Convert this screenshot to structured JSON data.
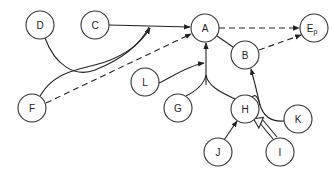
{
  "diagram": {
    "type": "directed-graph",
    "nodes": [
      {
        "id": "D",
        "label": "D",
        "x": 40,
        "y": 25
      },
      {
        "id": "C",
        "label": "C",
        "x": 95,
        "y": 25
      },
      {
        "id": "A",
        "label": "A",
        "x": 205,
        "y": 28
      },
      {
        "id": "Ep",
        "label": "E",
        "sub": "p",
        "x": 314,
        "y": 28
      },
      {
        "id": "B",
        "label": "B",
        "x": 245,
        "y": 55
      },
      {
        "id": "L",
        "label": "L",
        "x": 145,
        "y": 82
      },
      {
        "id": "G",
        "label": "G",
        "x": 178,
        "y": 108
      },
      {
        "id": "H",
        "label": "H",
        "x": 245,
        "y": 109
      },
      {
        "id": "K",
        "label": "K",
        "x": 298,
        "y": 119
      },
      {
        "id": "F",
        "label": "F",
        "x": 32,
        "y": 108
      },
      {
        "id": "J",
        "label": "J",
        "x": 218,
        "y": 152
      },
      {
        "id": "I",
        "label": "I",
        "x": 280,
        "y": 152
      }
    ],
    "edges": [
      {
        "from": "C",
        "to": "A",
        "style": "solid",
        "arrow": "filled"
      },
      {
        "from": "D",
        "to": "A",
        "style": "solid",
        "arrow": "filled"
      },
      {
        "from": "F",
        "to": "A",
        "style": "solid",
        "arrow": "filled"
      },
      {
        "from": "F",
        "to": "A",
        "style": "dashed",
        "arrow": "filled"
      },
      {
        "from": "A",
        "to": "Ep",
        "style": "dashed",
        "arrow": "filled"
      },
      {
        "from": "A",
        "to": "B",
        "style": "solid",
        "arrow": "none"
      },
      {
        "from": "B",
        "to": "Ep",
        "style": "dashed",
        "arrow": "filled"
      },
      {
        "from": "L",
        "to": "A",
        "style": "solid",
        "arrow": "filled"
      },
      {
        "from": "G",
        "to": "A",
        "style": "solid",
        "arrow": "filled"
      },
      {
        "from": "H",
        "to": "A",
        "style": "solid",
        "arrow": "filled"
      },
      {
        "from": "K",
        "to": "B",
        "style": "solid",
        "arrow": "filled"
      },
      {
        "from": "H",
        "to": "B",
        "style": "solid",
        "arrow": "filled"
      },
      {
        "from": "J",
        "to": "H",
        "style": "solid",
        "arrow": "filled"
      },
      {
        "from": "I",
        "to": "H",
        "style": "double",
        "arrow": "hollow"
      }
    ]
  }
}
